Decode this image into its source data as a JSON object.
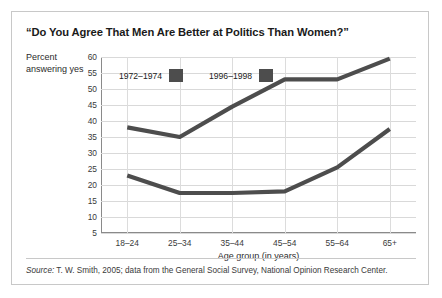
{
  "title": "“Do You Agree That Men Are Better at Politics Than Women?”",
  "source": {
    "prefix": "Source:",
    "text": " T. W. Smith, 2005; data from the General Social Survey, National Opinion Research Center."
  },
  "chart_data": {
    "type": "line",
    "title": "“Do You Agree That Men Are Better at Politics Than Women?”",
    "xlabel": "Age group (in years)",
    "ylabel": "Percent answering yes",
    "categories": [
      "18–24",
      "25–34",
      "35–44",
      "45–54",
      "55–64",
      "65+"
    ],
    "yticks": [
      5,
      10,
      15,
      20,
      25,
      30,
      35,
      40,
      45,
      50,
      55,
      60
    ],
    "ylim": [
      5,
      60
    ],
    "grid": true,
    "legend_position": "inside-top-left",
    "series": [
      {
        "name": "1972–1974",
        "color": "#4d4d4d",
        "values": [
          38,
          35,
          44.5,
          53,
          53,
          59.5
        ]
      },
      {
        "name": "1996–1998",
        "color": "#4d4d4d",
        "values": [
          23,
          17.5,
          17.5,
          18,
          25.5,
          37.5
        ]
      }
    ]
  }
}
